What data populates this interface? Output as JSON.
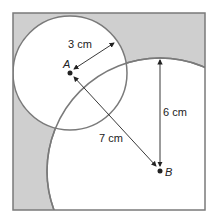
{
  "labels": {
    "point_a": "A",
    "point_b": "B",
    "radius_small": "3 cm",
    "radius_large": "6 cm",
    "distance_ab": "7 cm"
  },
  "colors": {
    "shade": "#cfcfcf",
    "stroke": "#7a7a7a",
    "arrow": "#222222"
  }
}
